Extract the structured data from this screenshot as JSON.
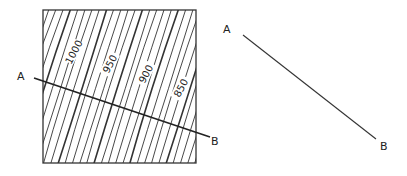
{
  "map": {
    "contour_labels": [
      {
        "text": "1000",
        "x": 74,
        "y": 52,
        "rot": -62
      },
      {
        "text": "950",
        "x": 110,
        "y": 64,
        "rot": -62
      },
      {
        "text": "900",
        "x": 146,
        "y": 74,
        "rot": -62
      },
      {
        "text": "850",
        "x": 181,
        "y": 88,
        "rot": -62
      }
    ],
    "section_start_label": "A",
    "section_end_label": "B"
  },
  "profile": {
    "start_label": "A",
    "end_label": "B"
  },
  "colors": {
    "ink": "#222222",
    "background": "#ffffff"
  }
}
